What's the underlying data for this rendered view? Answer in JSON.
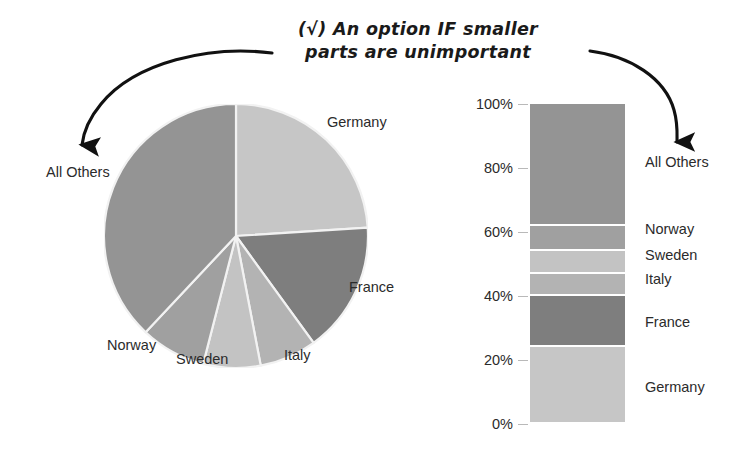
{
  "title": {
    "line1": "(√) An option IF smaller",
    "line2": "parts are unimportant",
    "check_glyph": "√"
  },
  "annotations": {
    "left_arrow_name": "curved-arrow-to-pie-all-others",
    "right_arrow_name": "curved-arrow-to-bar-all-others"
  },
  "palette": {
    "germany": "#c6c6c6",
    "france": "#7e7e7e",
    "italy": "#b3b3b3",
    "sweden": "#c3c3c3",
    "norway": "#a0a0a0",
    "all_others": "#949494",
    "slice_divider": "#f2f2f2",
    "text": "#2b2b2b",
    "arrow": "#111111"
  },
  "chart_data": [
    {
      "type": "pie",
      "title": "",
      "labels": [
        "Germany",
        "France",
        "Italy",
        "Sweden",
        "Norway",
        "All Others"
      ],
      "values": [
        24,
        16,
        7,
        7,
        8,
        38
      ],
      "unit": "%",
      "start_angle_deg": 0,
      "direction": "clockwise",
      "colors": [
        "#c6c6c6",
        "#7e7e7e",
        "#b3b3b3",
        "#c3c3c3",
        "#a0a0a0",
        "#949494"
      ],
      "legend": "none",
      "labels_placement": "outside-adjacent"
    },
    {
      "type": "bar",
      "subtype": "stacked-100-percent",
      "title": "",
      "categories": [
        ""
      ],
      "ylabel": "",
      "ylim": [
        0,
        100
      ],
      "yticks": [
        "0%",
        "20%",
        "40%",
        "60%",
        "80%",
        "100%"
      ],
      "ytick_values": [
        0,
        20,
        40,
        60,
        80,
        100
      ],
      "grid": false,
      "legend": "right-side-direct-labels",
      "series": [
        {
          "name": "Germany",
          "value": 24,
          "from": 0,
          "to": 24,
          "color": "#c6c6c6"
        },
        {
          "name": "France",
          "value": 16,
          "from": 24,
          "to": 40,
          "color": "#7e7e7e"
        },
        {
          "name": "Italy",
          "value": 7,
          "from": 40,
          "to": 47,
          "color": "#b3b3b3"
        },
        {
          "name": "Sweden",
          "value": 7,
          "from": 47,
          "to": 54,
          "color": "#c3c3c3"
        },
        {
          "name": "Norway",
          "value": 8,
          "from": 54,
          "to": 62,
          "color": "#a0a0a0"
        },
        {
          "name": "All Others",
          "value": 38,
          "from": 62,
          "to": 100,
          "color": "#949494"
        }
      ]
    }
  ],
  "pie_labels": [
    {
      "text": "All Others",
      "x": 46,
      "y": 164
    },
    {
      "text": "Germany",
      "x": 327,
      "y": 114
    },
    {
      "text": "France",
      "x": 349,
      "y": 279
    },
    {
      "text": "Italy",
      "x": 284,
      "y": 347
    },
    {
      "text": "Sweden",
      "x": 176,
      "y": 351
    },
    {
      "text": "Norway",
      "x": 107,
      "y": 337
    }
  ],
  "bar_axis_ticks": [
    {
      "text": "100%",
      "y": 96
    },
    {
      "text": "80%",
      "y": 160
    },
    {
      "text": "60%",
      "y": 224
    },
    {
      "text": "40%",
      "y": 288
    },
    {
      "text": "20%",
      "y": 352
    },
    {
      "text": "0%",
      "y": 416
    }
  ],
  "bar_labels": [
    {
      "text": "All Others",
      "y": 154
    },
    {
      "text": "Norway",
      "y": 221
    },
    {
      "text": "Sweden",
      "y": 247
    },
    {
      "text": "Italy",
      "y": 271
    },
    {
      "text": "France",
      "y": 314
    },
    {
      "text": "Germany",
      "y": 379
    }
  ]
}
